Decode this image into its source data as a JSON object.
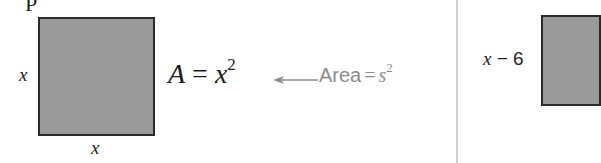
{
  "figure": {
    "top_fragment": "P",
    "left_panel": {
      "square_side_label_left": "x",
      "square_side_label_bottom": "x",
      "formula": {
        "lhs": "A",
        "equals": "=",
        "base": "x",
        "exponent": "2"
      },
      "annotation": {
        "word": "Area",
        "equals": "=",
        "base": "s",
        "exponent": "2"
      },
      "colors": {
        "square_fill": "#9a9a9a",
        "square_border": "#2a2a2a",
        "annotation": "#8c8c8c"
      }
    },
    "right_panel": {
      "side_label": {
        "var": "x",
        "rest": " − 6"
      }
    },
    "divider_color": "#cfcfcf"
  }
}
